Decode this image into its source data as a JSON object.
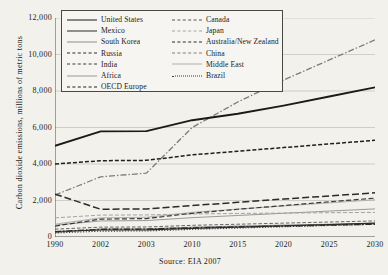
{
  "chart": {
    "type": "line",
    "title": "",
    "source_note": "Source: EIA 2007",
    "ylabel": "Carbon dioxide emissions, millions of metric tons",
    "xlabel": "",
    "ylim": [
      0,
      12000
    ],
    "yticks": [
      "0",
      "2,000",
      "4,000",
      "6,000",
      "8,000",
      "10,000",
      "12,000"
    ],
    "ytick_values": [
      0,
      2000,
      4000,
      6000,
      8000,
      10000,
      12000
    ],
    "xticks": [
      "1990",
      "2002",
      "2003",
      "2010",
      "2015",
      "2020",
      "2025",
      "2030"
    ],
    "grid": "horizontal",
    "legend_position": "top-left-inside"
  },
  "chart_data": {
    "type": "line",
    "title": "",
    "xlabel": "",
    "ylabel": "Carbon dioxide emissions, millions of metric tons",
    "ylim": [
      0,
      12000
    ],
    "grid": "horizontal",
    "legend_position": "top-left-inside",
    "categories": [
      "1990",
      "2002",
      "2003",
      "2010",
      "2015",
      "2020",
      "2025",
      "2030"
    ],
    "yticks": [
      0,
      2000,
      4000,
      6000,
      8000,
      10000,
      12000
    ],
    "series": [
      {
        "name": "United States",
        "style": "solid-thick",
        "color": "#1a1a1a",
        "values": [
          5000,
          5790,
          5800,
          6400,
          6750,
          7200,
          7700,
          8200
        ]
      },
      {
        "name": "Mexico",
        "style": "solid",
        "color": "#2b2b2b",
        "values": [
          300,
          380,
          390,
          470,
          540,
          610,
          680,
          760
        ]
      },
      {
        "name": "South Korea",
        "style": "solid-light",
        "color": "#8d8d8d",
        "values": [
          240,
          440,
          450,
          540,
          600,
          650,
          700,
          750
        ]
      },
      {
        "name": "Russia",
        "style": "long-dash",
        "color": "#2b2b2b",
        "values": [
          2350,
          1520,
          1540,
          1720,
          1900,
          2080,
          2250,
          2420
        ]
      },
      {
        "name": "India",
        "style": "dash-dash",
        "color": "#3a3a3a",
        "values": [
          600,
          980,
          1010,
          1300,
          1520,
          1720,
          1930,
          2130
        ]
      },
      {
        "name": "Africa",
        "style": "solid-light",
        "color": "#9a9a9a",
        "values": [
          650,
          880,
          900,
          1060,
          1180,
          1300,
          1420,
          1540
        ]
      },
      {
        "name": "OECD Europe",
        "style": "dashed",
        "color": "#1f1f1f",
        "values": [
          4000,
          4180,
          4200,
          4500,
          4700,
          4900,
          5100,
          5300
        ]
      },
      {
        "name": "Canada",
        "style": "dashed-thin",
        "color": "#555555",
        "values": [
          430,
          540,
          550,
          640,
          700,
          760,
          820,
          880
        ]
      },
      {
        "name": "Japan",
        "style": "dash-light",
        "color": "#a3a3a3",
        "values": [
          1050,
          1200,
          1210,
          1260,
          1290,
          1310,
          1330,
          1350
        ]
      },
      {
        "name": "Australia/New Zealand",
        "style": "dash-dot",
        "color": "#2b2b2b",
        "values": [
          290,
          420,
          430,
          500,
          550,
          600,
          650,
          700
        ]
      },
      {
        "name": "China",
        "style": "dash-dot-light",
        "color": "#7c7c7c",
        "values": [
          2300,
          3300,
          3500,
          6000,
          7400,
          8600,
          9700,
          10800
        ]
      },
      {
        "name": "Middle East",
        "style": "solid-light",
        "color": "#b0b0b0",
        "values": [
          700,
          1050,
          1080,
          1350,
          1530,
          1700,
          1870,
          2040
        ]
      },
      {
        "name": "Brazil",
        "style": "dotted",
        "color": "#3d3d3d",
        "values": [
          220,
          320,
          330,
          420,
          490,
          560,
          630,
          700
        ]
      }
    ]
  },
  "legend": {
    "column_left": [
      "United States",
      "Mexico",
      "South Korea",
      "Russia",
      "India",
      "Africa",
      "OECD Europe"
    ],
    "column_right": [
      "Canada",
      "Japan",
      "Australia/New Zealand",
      "China",
      "Middle East",
      "Brazil"
    ]
  }
}
